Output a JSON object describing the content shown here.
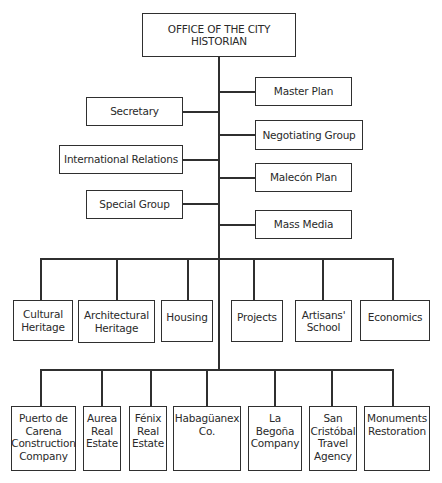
{
  "chart": {
    "root": {
      "label": "OFFICE OF THE CITY\nHISTORIAN"
    },
    "left_staff": [
      {
        "label": "Secretary"
      },
      {
        "label": "International Relations"
      },
      {
        "label": "Special Group"
      }
    ],
    "right_staff": [
      {
        "label": "Master Plan"
      },
      {
        "label": "Negotiating Group"
      },
      {
        "label": "Malecón Plan"
      },
      {
        "label": "Mass Media"
      }
    ],
    "departments": [
      {
        "label": "Cultural\nHeritage"
      },
      {
        "label": "Architectural\nHeritage"
      },
      {
        "label": "Housing"
      },
      {
        "label": "Projects"
      },
      {
        "label": "Artisans'\nSchool"
      },
      {
        "label": "Economics"
      }
    ],
    "enterprises": [
      {
        "label": "Puerto de\nCarena\nConstruction\nCompany"
      },
      {
        "label": "Aurea\nReal\nEstate"
      },
      {
        "label": "Fénix\nReal\nEstate"
      },
      {
        "label": "Habagüanex\nCo."
      },
      {
        "label": "La\nBegoña\nCompany"
      },
      {
        "label": "San\nCristóbal\nTravel\nAgency"
      },
      {
        "label": "Monuments\nRestoration"
      }
    ]
  }
}
